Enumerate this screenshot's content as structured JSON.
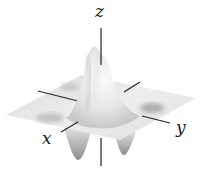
{
  "figure": {
    "type": "3d-surface-plot",
    "axes": {
      "x_label": "x",
      "y_label": "y",
      "z_label": "z"
    },
    "colors": {
      "axis": "#222222",
      "surface_light": "#f2f2f2",
      "surface_mid": "#d6d6d6",
      "surface_dark": "#9a9a9a",
      "background": "#ffffff"
    }
  }
}
